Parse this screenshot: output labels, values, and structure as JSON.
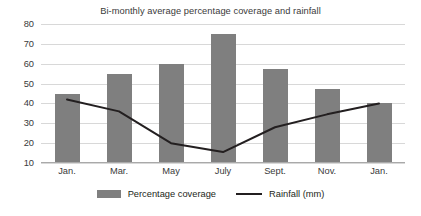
{
  "chart_data": {
    "type": "bar",
    "title": "Bi-monthly average percentage coverage and rainfall",
    "xlabel": "",
    "ylabel": "",
    "ylim": [
      10,
      80
    ],
    "ytick_step": 10,
    "yticks": [
      80,
      70,
      60,
      50,
      40,
      30,
      20,
      10
    ],
    "grid": true,
    "legend_position": "bottom",
    "categories": [
      "Jan.",
      "Mar.",
      "May",
      "July",
      "Sept.",
      "Nov.",
      "Jan."
    ],
    "series": [
      {
        "name": "Percentage coverage",
        "type": "bar",
        "color": "#7f7f7f",
        "values": [
          45,
          55,
          60,
          75,
          57.5,
          47.5,
          40
        ]
      },
      {
        "name": "Rainfall (mm)",
        "type": "line",
        "color": "#231f20",
        "values": [
          42,
          36,
          20,
          15.5,
          28,
          34.5,
          40
        ]
      }
    ]
  },
  "legend": {
    "items": [
      {
        "label": "Percentage coverage",
        "swatch": "bar-swatch"
      },
      {
        "label": "Rainfall (mm)",
        "swatch": "line-swatch"
      }
    ]
  }
}
